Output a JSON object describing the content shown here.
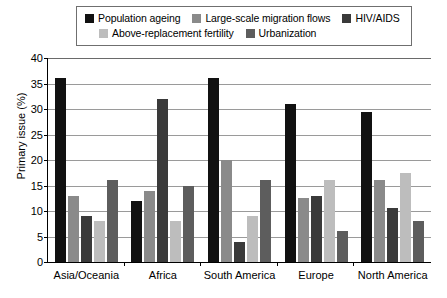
{
  "chart_data": {
    "type": "bar",
    "title": "",
    "xlabel": "",
    "ylabel": "Primary issue (%)",
    "ylim": [
      0,
      40
    ],
    "yticks": [
      0,
      5,
      10,
      15,
      20,
      25,
      30,
      35,
      40
    ],
    "grid": true,
    "legend_position": "top",
    "categories": [
      "Asia/Oceania",
      "Africa",
      "South America",
      "Europe",
      "North America"
    ],
    "series": [
      {
        "name": "Population ageing",
        "color": "#111111",
        "values": [
          36,
          12,
          36,
          31,
          29.5
        ]
      },
      {
        "name": "Large-scale migration flows",
        "color": "#8a8a8a",
        "values": [
          13,
          14,
          20,
          12.5,
          16
        ]
      },
      {
        "name": "HIV/AIDS",
        "color": "#3a3a3a",
        "values": [
          9,
          32,
          4,
          13,
          10.5
        ]
      },
      {
        "name": "Above-replacement fertility",
        "color": "#bdbdbd",
        "values": [
          8,
          8,
          9,
          16,
          17.5
        ]
      },
      {
        "name": "Urbanization",
        "color": "#5d5d5d",
        "values": [
          16,
          15,
          16,
          6,
          8
        ]
      }
    ]
  }
}
